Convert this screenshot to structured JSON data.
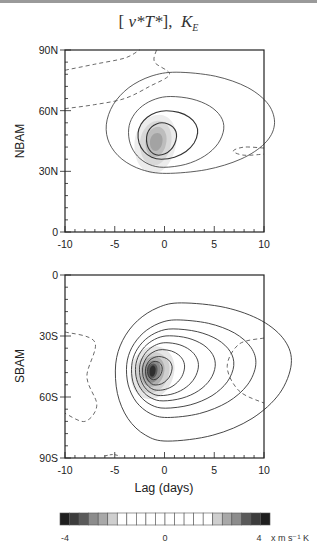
{
  "title": {
    "bracket_open": "[",
    "expr": "v*T*",
    "bracket_close": "],",
    "k": "K",
    "k_sub": "E"
  },
  "chart_data": [
    {
      "type": "heatmap",
      "panel": "NBAM",
      "title": "[v*T*], K_E",
      "xlabel": "",
      "ylabel": "NBAM",
      "xlim": [
        -10,
        10
      ],
      "ylim": [
        0,
        90
      ],
      "xticks": [
        "-10",
        "-5",
        "0",
        "5",
        "10"
      ],
      "yticks": [
        "0",
        "30N",
        "60N",
        "90N"
      ],
      "contours": {
        "positive_levels": [
          1,
          2,
          3,
          4
        ],
        "negative_dashed": true,
        "max_center": {
          "lag": -0.7,
          "lat": 45
        },
        "shaded_peak": 2.5
      }
    },
    {
      "type": "heatmap",
      "panel": "SBAM",
      "xlabel": "Lag (days)",
      "ylabel": "SBAM",
      "xlim": [
        -10,
        10
      ],
      "ylim": [
        -90,
        0
      ],
      "xticks": [
        "-10",
        "-5",
        "0",
        "5",
        "10"
      ],
      "yticks": [
        "90S",
        "60S",
        "30S",
        "0"
      ],
      "contours": {
        "positive_levels": [
          1,
          2,
          3,
          4,
          5,
          6,
          7,
          8
        ],
        "negative_dashed": true,
        "max_center": {
          "lag": -1.2,
          "lat": -47
        },
        "shaded_peak": 4
      }
    }
  ],
  "colorbar": {
    "min_label": "-4",
    "mid_label": "0",
    "max_label": "4",
    "units": "x  m s⁻¹ K",
    "range": [
      -4,
      4
    ],
    "n_boxes": 22,
    "colors": [
      "#1e1e1e",
      "#3c3c3c",
      "#5a5a5a",
      "#8c8c8c",
      "#a8a8a8",
      "#cfcfcf",
      "#ffffff",
      "#ffffff",
      "#ffffff",
      "#ffffff",
      "#ffffff",
      "#ffffff",
      "#ffffff",
      "#ffffff",
      "#ffffff",
      "#ffffff",
      "#cfcfcf",
      "#a8a8a8",
      "#8c8c8c",
      "#5a5a5a",
      "#3c3c3c",
      "#1e1e1e"
    ]
  }
}
